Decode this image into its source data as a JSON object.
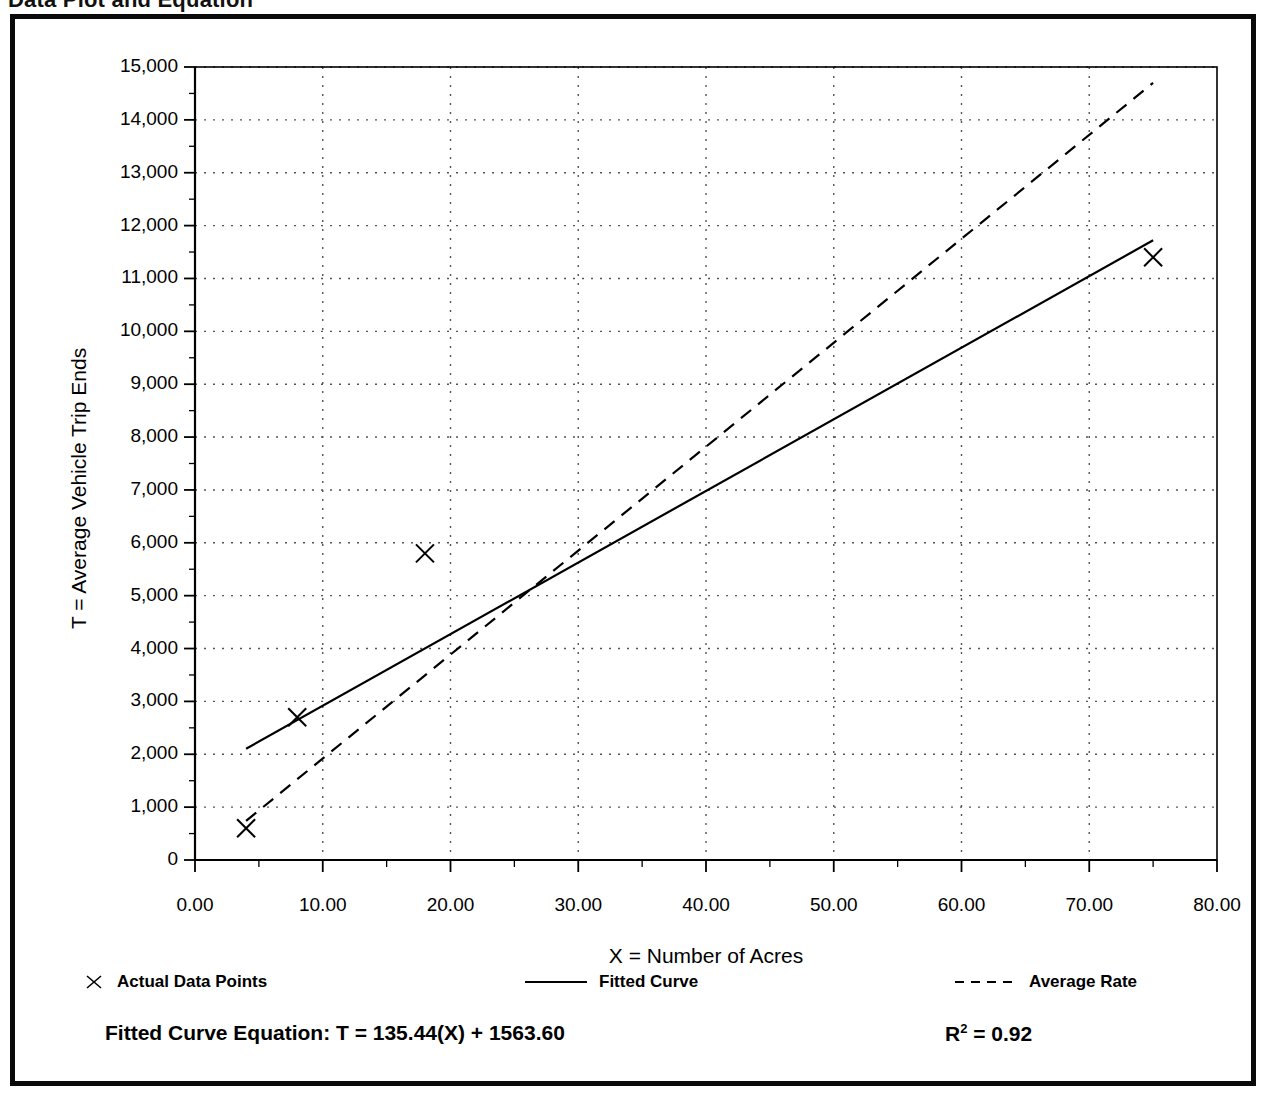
{
  "page": {
    "heading": "Data Plot and Equation"
  },
  "chart_data": {
    "type": "scatter",
    "title": "Data Plot and Equation",
    "xlabel": "X = Number of Acres",
    "ylabel": "T = Average Vehicle Trip Ends",
    "xlim": [
      0,
      80
    ],
    "ylim": [
      0,
      15000
    ],
    "x_major_step": 10,
    "x_minor_step": 5,
    "y_major_step": 1000,
    "y_minor_step": 500,
    "grid": true,
    "grid_style": "dotted",
    "legend_position": "below-plot",
    "xtick_labels": [
      "0.00",
      "10.00",
      "20.00",
      "30.00",
      "40.00",
      "50.00",
      "60.00",
      "70.00",
      "80.00"
    ],
    "xtick_values": [
      0,
      10,
      20,
      30,
      40,
      50,
      60,
      70,
      80
    ],
    "ytick_labels": [
      "0",
      "1,000",
      "2,000",
      "3,000",
      "4,000",
      "5,000",
      "6,000",
      "7,000",
      "8,000",
      "9,000",
      "10,000",
      "11,000",
      "12,000",
      "13,000",
      "14,000",
      "15,000"
    ],
    "ytick_values": [
      0,
      1000,
      2000,
      3000,
      4000,
      5000,
      6000,
      7000,
      8000,
      9000,
      10000,
      11000,
      12000,
      13000,
      14000,
      15000
    ],
    "series": [
      {
        "name": "Actual Data Points",
        "type": "scatter",
        "marker": "x",
        "color": "#000000",
        "points": [
          {
            "x": 4.0,
            "y": 600
          },
          {
            "x": 8.0,
            "y": 2700
          },
          {
            "x": 18.0,
            "y": 5800
          },
          {
            "x": 75.0,
            "y": 11400
          }
        ]
      },
      {
        "name": "Fitted Curve",
        "type": "line",
        "style": "solid",
        "color": "#000000",
        "equation": "T = 135.44(X) + 1563.60",
        "slope": 135.44,
        "intercept": 1563.6,
        "points": [
          {
            "x": 4.0,
            "y": 2105
          },
          {
            "x": 75.0,
            "y": 11722
          }
        ]
      },
      {
        "name": "Average Rate",
        "type": "line",
        "style": "dashed",
        "color": "#000000",
        "slope": 197.0,
        "points": [
          {
            "x": 4.0,
            "y": 740
          },
          {
            "x": 75.0,
            "y": 14700
          }
        ]
      }
    ],
    "annotations": {
      "equation_label": "Fitted Curve Equation:  T = 135.44(X) + 1563.60",
      "r_squared_prefix": "R",
      "r_squared_exp": "2",
      "r_squared_value": " = 0.92"
    }
  },
  "legend": {
    "items": [
      {
        "label": "Actual Data Points",
        "marker": "x-marker"
      },
      {
        "label": "Fitted Curve",
        "marker": "solid-line"
      },
      {
        "label": "Average Rate",
        "marker": "dashed-line"
      }
    ]
  },
  "colors": {
    "ink": "#000000",
    "grid": "#555555",
    "frame": "#0a0a0a",
    "background": "#ffffff"
  }
}
